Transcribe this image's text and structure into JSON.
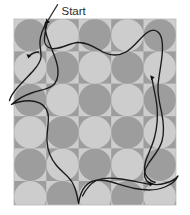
{
  "figure": {
    "kind": "geometric-tiling-with-closed-path",
    "background_color": "#ffffff",
    "annotation": {
      "label": "Start",
      "label_x": 62,
      "label_y": 12,
      "leader_line": {
        "x1": 57.5,
        "y1": 4.5,
        "x2": 48.5,
        "y2": 19.5
      },
      "arrow_target": {
        "x": 47.5,
        "y": 21.5
      }
    },
    "pattern": {
      "origin_x": 14,
      "origin_y": 19,
      "width": 162,
      "height": 186,
      "tile_size": 32.4,
      "cols": 5,
      "rows": 5.74,
      "colors": {
        "light_square": "#cdcdcd",
        "dark_square": "#9d9d9d",
        "light_motif": "#d9d9d9",
        "dark_motif": "#a8a8a8",
        "border": "#b4b4b4"
      },
      "motif": "four-pointed-astroid-star-of-quarter-circles"
    },
    "curve": {
      "color": "#1a1a1a",
      "stroke_width": 1.3,
      "closed": true,
      "marker_color": "#111111",
      "markers": [
        {
          "x": 47.5,
          "y": 21.0,
          "type": "start-tick"
        },
        {
          "x": 28.5,
          "y": 56.5,
          "type": "arrow"
        },
        {
          "x": 152.0,
          "y": 78.0,
          "type": "arrow"
        },
        {
          "x": 151.5,
          "y": 184.5,
          "type": "arrow"
        }
      ]
    }
  }
}
